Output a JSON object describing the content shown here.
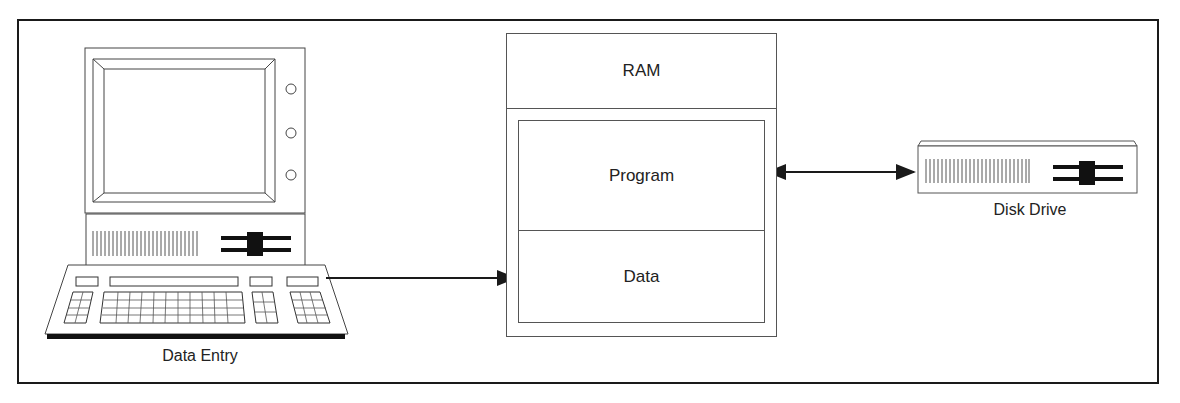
{
  "diagram": {
    "type": "computer memory model",
    "nodes": [
      {
        "id": "data-entry",
        "label": "Data Entry",
        "kind": "computer-terminal"
      },
      {
        "id": "ram",
        "label": "RAM",
        "kind": "memory-block",
        "segments": [
          {
            "label": "Program"
          },
          {
            "label": "Data"
          }
        ]
      },
      {
        "id": "disk-drive",
        "label": "Disk Drive",
        "kind": "storage-device"
      }
    ],
    "edges": [
      {
        "from": "data-entry",
        "to": "ram.data",
        "direction": "one-way"
      },
      {
        "from": "ram.program",
        "to": "disk-drive",
        "direction": "two-way"
      }
    ]
  },
  "labels": {
    "data_entry": "Data Entry",
    "ram": "RAM",
    "program": "Program",
    "data": "Data",
    "disk_drive": "Disk Drive"
  },
  "colors": {
    "line": "#1a1a1a",
    "thin_line": "#555555",
    "background": "#ffffff"
  }
}
